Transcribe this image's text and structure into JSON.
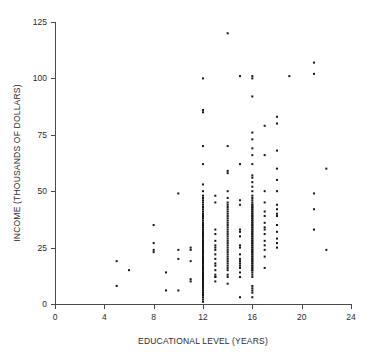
{
  "figure": {
    "kind": "scatter-plot",
    "background": "#ffffff",
    "point_color": "#151515",
    "axis_color": "#4a4a4a"
  },
  "axes": {
    "x_title": "EDUCATIONAL LEVEL (YEARS)",
    "y_title": "INCOME (THOUSANDS OF DOLLARS)",
    "x_ticks": [
      "0",
      "4",
      "8",
      "12",
      "16",
      "20",
      "24"
    ],
    "y_ticks": [
      "0",
      "25",
      "50",
      "75",
      "100",
      "125"
    ]
  },
  "chart_data": {
    "type": "scatter",
    "title": "",
    "xlabel": "EDUCATIONAL LEVEL (YEARS)",
    "ylabel": "INCOME (THOUSANDS OF DOLLARS)",
    "xlim": [
      0,
      24
    ],
    "ylim": [
      0,
      125
    ],
    "xticks": [
      0,
      4,
      8,
      12,
      16,
      20,
      24
    ],
    "yticks": [
      0,
      25,
      50,
      75,
      100,
      125
    ],
    "grid": false,
    "legend": null,
    "marker": "square",
    "marker_size": 2,
    "marker_color": "#151515",
    "series": [
      {
        "name": "Respondents",
        "points": [
          [
            5,
            19
          ],
          [
            5,
            8
          ],
          [
            6,
            15
          ],
          [
            8,
            35
          ],
          [
            8,
            27
          ],
          [
            8,
            24
          ],
          [
            8,
            23
          ],
          [
            9,
            14
          ],
          [
            9,
            6
          ],
          [
            10,
            49
          ],
          [
            10,
            24
          ],
          [
            10,
            20
          ],
          [
            10,
            6
          ],
          [
            11,
            25
          ],
          [
            11,
            24
          ],
          [
            11,
            19
          ],
          [
            11,
            11
          ],
          [
            11,
            10
          ],
          [
            12,
            100
          ],
          [
            12,
            86
          ],
          [
            12,
            85
          ],
          [
            12,
            70
          ],
          [
            12,
            62
          ],
          [
            12,
            53
          ],
          [
            12,
            50
          ],
          [
            12,
            48
          ],
          [
            12,
            47
          ],
          [
            12,
            46
          ],
          [
            12,
            45
          ],
          [
            12,
            44
          ],
          [
            12,
            43
          ],
          [
            12,
            42
          ],
          [
            12,
            41
          ],
          [
            12,
            40
          ],
          [
            12,
            40
          ],
          [
            12,
            39
          ],
          [
            12,
            38
          ],
          [
            12,
            38
          ],
          [
            12,
            37
          ],
          [
            12,
            36
          ],
          [
            12,
            36
          ],
          [
            12,
            35
          ],
          [
            12,
            35
          ],
          [
            12,
            34
          ],
          [
            12,
            34
          ],
          [
            12,
            33
          ],
          [
            12,
            33
          ],
          [
            12,
            32
          ],
          [
            12,
            32
          ],
          [
            12,
            31
          ],
          [
            12,
            31
          ],
          [
            12,
            30
          ],
          [
            12,
            30
          ],
          [
            12,
            30
          ],
          [
            12,
            29
          ],
          [
            12,
            29
          ],
          [
            12,
            28
          ],
          [
            12,
            28
          ],
          [
            12,
            28
          ],
          [
            12,
            27
          ],
          [
            12,
            27
          ],
          [
            12,
            26
          ],
          [
            12,
            26
          ],
          [
            12,
            26
          ],
          [
            12,
            25
          ],
          [
            12,
            25
          ],
          [
            12,
            25
          ],
          [
            12,
            24
          ],
          [
            12,
            24
          ],
          [
            12,
            24
          ],
          [
            12,
            23
          ],
          [
            12,
            23
          ],
          [
            12,
            23
          ],
          [
            12,
            22
          ],
          [
            12,
            22
          ],
          [
            12,
            22
          ],
          [
            12,
            21
          ],
          [
            12,
            21
          ],
          [
            12,
            21
          ],
          [
            12,
            20
          ],
          [
            12,
            20
          ],
          [
            12,
            20
          ],
          [
            12,
            19
          ],
          [
            12,
            19
          ],
          [
            12,
            19
          ],
          [
            12,
            18
          ],
          [
            12,
            18
          ],
          [
            12,
            18
          ],
          [
            12,
            17
          ],
          [
            12,
            17
          ],
          [
            12,
            17
          ],
          [
            12,
            16
          ],
          [
            12,
            16
          ],
          [
            12,
            16
          ],
          [
            12,
            15
          ],
          [
            12,
            15
          ],
          [
            12,
            15
          ],
          [
            12,
            14
          ],
          [
            12,
            14
          ],
          [
            12,
            14
          ],
          [
            12,
            13
          ],
          [
            12,
            13
          ],
          [
            12,
            13
          ],
          [
            12,
            12
          ],
          [
            12,
            12
          ],
          [
            12,
            12
          ],
          [
            12,
            11
          ],
          [
            12,
            11
          ],
          [
            12,
            11
          ],
          [
            12,
            10
          ],
          [
            12,
            10
          ],
          [
            12,
            10
          ],
          [
            12,
            9
          ],
          [
            12,
            9
          ],
          [
            12,
            9
          ],
          [
            12,
            8
          ],
          [
            12,
            8
          ],
          [
            12,
            7
          ],
          [
            12,
            7
          ],
          [
            12,
            6
          ],
          [
            12,
            6
          ],
          [
            12,
            5
          ],
          [
            12,
            5
          ],
          [
            12,
            4
          ],
          [
            12,
            3
          ],
          [
            12,
            2
          ],
          [
            12,
            1
          ],
          [
            13,
            48
          ],
          [
            13,
            45
          ],
          [
            13,
            33
          ],
          [
            13,
            31
          ],
          [
            13,
            28
          ],
          [
            13,
            26
          ],
          [
            13,
            25
          ],
          [
            13,
            24
          ],
          [
            13,
            22
          ],
          [
            13,
            20
          ],
          [
            13,
            18
          ],
          [
            13,
            17
          ],
          [
            13,
            15
          ],
          [
            13,
            13
          ],
          [
            13,
            12
          ],
          [
            13,
            12
          ],
          [
            13,
            10
          ],
          [
            14,
            120
          ],
          [
            14,
            70
          ],
          [
            14,
            59
          ],
          [
            14,
            58
          ],
          [
            14,
            50
          ],
          [
            14,
            47
          ],
          [
            14,
            45
          ],
          [
            14,
            44
          ],
          [
            14,
            43
          ],
          [
            14,
            42
          ],
          [
            14,
            41
          ],
          [
            14,
            40
          ],
          [
            14,
            39
          ],
          [
            14,
            38
          ],
          [
            14,
            37
          ],
          [
            14,
            36
          ],
          [
            14,
            35
          ],
          [
            14,
            34
          ],
          [
            14,
            33
          ],
          [
            14,
            32
          ],
          [
            14,
            31
          ],
          [
            14,
            30
          ],
          [
            14,
            29
          ],
          [
            14,
            28
          ],
          [
            14,
            27
          ],
          [
            14,
            26
          ],
          [
            14,
            25
          ],
          [
            14,
            24
          ],
          [
            14,
            23
          ],
          [
            14,
            22
          ],
          [
            14,
            21
          ],
          [
            14,
            20
          ],
          [
            14,
            19
          ],
          [
            14,
            18
          ],
          [
            14,
            17
          ],
          [
            14,
            16
          ],
          [
            14,
            15
          ],
          [
            14,
            13
          ],
          [
            14,
            12
          ],
          [
            14,
            9
          ],
          [
            15,
            101
          ],
          [
            15,
            62
          ],
          [
            15,
            46
          ],
          [
            15,
            44
          ],
          [
            15,
            33
          ],
          [
            15,
            32
          ],
          [
            15,
            30
          ],
          [
            15,
            26
          ],
          [
            15,
            25
          ],
          [
            15,
            22
          ],
          [
            15,
            20
          ],
          [
            15,
            19
          ],
          [
            15,
            18
          ],
          [
            15,
            17
          ],
          [
            15,
            16
          ],
          [
            15,
            14
          ],
          [
            15,
            12
          ],
          [
            15,
            3
          ],
          [
            16,
            101
          ],
          [
            16,
            100
          ],
          [
            16,
            92
          ],
          [
            16,
            76
          ],
          [
            16,
            73
          ],
          [
            16,
            69
          ],
          [
            16,
            66
          ],
          [
            16,
            62
          ],
          [
            16,
            57
          ],
          [
            16,
            56
          ],
          [
            16,
            54
          ],
          [
            16,
            52
          ],
          [
            16,
            50
          ],
          [
            16,
            48
          ],
          [
            16,
            47
          ],
          [
            16,
            46
          ],
          [
            16,
            45
          ],
          [
            16,
            44
          ],
          [
            16,
            44
          ],
          [
            16,
            43
          ],
          [
            16,
            43
          ],
          [
            16,
            42
          ],
          [
            16,
            42
          ],
          [
            16,
            41
          ],
          [
            16,
            41
          ],
          [
            16,
            40
          ],
          [
            16,
            40
          ],
          [
            16,
            39
          ],
          [
            16,
            39
          ],
          [
            16,
            38
          ],
          [
            16,
            38
          ],
          [
            16,
            37
          ],
          [
            16,
            37
          ],
          [
            16,
            36
          ],
          [
            16,
            36
          ],
          [
            16,
            35
          ],
          [
            16,
            35
          ],
          [
            16,
            34
          ],
          [
            16,
            34
          ],
          [
            16,
            33
          ],
          [
            16,
            33
          ],
          [
            16,
            32
          ],
          [
            16,
            32
          ],
          [
            16,
            31
          ],
          [
            16,
            31
          ],
          [
            16,
            30
          ],
          [
            16,
            30
          ],
          [
            16,
            29
          ],
          [
            16,
            29
          ],
          [
            16,
            28
          ],
          [
            16,
            28
          ],
          [
            16,
            27
          ],
          [
            16,
            27
          ],
          [
            16,
            26
          ],
          [
            16,
            26
          ],
          [
            16,
            25
          ],
          [
            16,
            25
          ],
          [
            16,
            24
          ],
          [
            16,
            24
          ],
          [
            16,
            23
          ],
          [
            16,
            23
          ],
          [
            16,
            22
          ],
          [
            16,
            22
          ],
          [
            16,
            21
          ],
          [
            16,
            21
          ],
          [
            16,
            20
          ],
          [
            16,
            20
          ],
          [
            16,
            19
          ],
          [
            16,
            19
          ],
          [
            16,
            18
          ],
          [
            16,
            18
          ],
          [
            16,
            17
          ],
          [
            16,
            17
          ],
          [
            16,
            16
          ],
          [
            16,
            16
          ],
          [
            16,
            15
          ],
          [
            16,
            15
          ],
          [
            16,
            14
          ],
          [
            16,
            13
          ],
          [
            16,
            12
          ],
          [
            16,
            8
          ],
          [
            16,
            7
          ],
          [
            16,
            6
          ],
          [
            16,
            5
          ],
          [
            16,
            3
          ],
          [
            17,
            79
          ],
          [
            17,
            66
          ],
          [
            17,
            50
          ],
          [
            17,
            45
          ],
          [
            17,
            41
          ],
          [
            17,
            39
          ],
          [
            17,
            36
          ],
          [
            17,
            34
          ],
          [
            17,
            33
          ],
          [
            17,
            31
          ],
          [
            17,
            28
          ],
          [
            17,
            26
          ],
          [
            17,
            24
          ],
          [
            17,
            21
          ],
          [
            17,
            16
          ],
          [
            18,
            83
          ],
          [
            18,
            80
          ],
          [
            18,
            68
          ],
          [
            18,
            60
          ],
          [
            18,
            55
          ],
          [
            18,
            50
          ],
          [
            18,
            44
          ],
          [
            18,
            42
          ],
          [
            18,
            40
          ],
          [
            18,
            39
          ],
          [
            18,
            35
          ],
          [
            18,
            32
          ],
          [
            18,
            29
          ],
          [
            18,
            27
          ],
          [
            18,
            25
          ],
          [
            19,
            101
          ],
          [
            21,
            107
          ],
          [
            21,
            102
          ],
          [
            21,
            49
          ],
          [
            21,
            42
          ],
          [
            21,
            33
          ],
          [
            22,
            60
          ],
          [
            22,
            24
          ]
        ]
      }
    ]
  }
}
